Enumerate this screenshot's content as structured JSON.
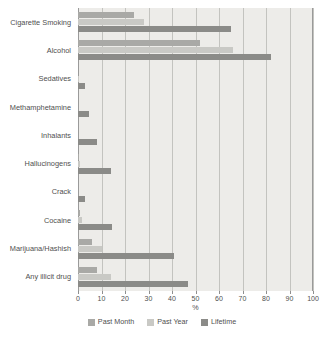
{
  "chart_data": {
    "type": "bar",
    "orientation": "horizontal",
    "title": "",
    "xlabel": "%",
    "ylabel": "",
    "xlim": [
      0,
      100
    ],
    "xticks": [
      0,
      10,
      20,
      30,
      40,
      50,
      60,
      70,
      80,
      90,
      100
    ],
    "xtick_labels": [
      "0",
      "10",
      "20",
      "30",
      "40",
      "50",
      "60",
      "70",
      "80",
      "90",
      "100"
    ],
    "grid": true,
    "grid_axis": "x",
    "legend_position": "bottom",
    "categories": [
      "Cigarette Smoking",
      "Alcohol",
      "Sedatives",
      "Methamphetamine",
      "Inhalants",
      "Hallucinogens",
      "Crack",
      "Cocaine",
      "Marijuana/Hashish",
      "Any illicit drug"
    ],
    "series": [
      {
        "name": "Past Month",
        "color": "#a9a9a6",
        "values": [
          24,
          52,
          0,
          0,
          0,
          0.5,
          0,
          0.7,
          6,
          8
        ]
      },
      {
        "name": "Past Year",
        "color": "#c9c9c5",
        "values": [
          28,
          66,
          0.5,
          0,
          0,
          1,
          0,
          1.5,
          10,
          14
        ]
      },
      {
        "name": "Lifetime",
        "color": "#8b8b88",
        "values": [
          65,
          82,
          3,
          4.5,
          8,
          14,
          3,
          14.5,
          41,
          47
        ]
      }
    ]
  },
  "legend": {
    "items": [
      {
        "label": "Past Month",
        "key": "s-past-month"
      },
      {
        "label": "Past Year",
        "key": "s-past-year"
      },
      {
        "label": "Lifetime",
        "key": "s-lifetime"
      }
    ]
  }
}
